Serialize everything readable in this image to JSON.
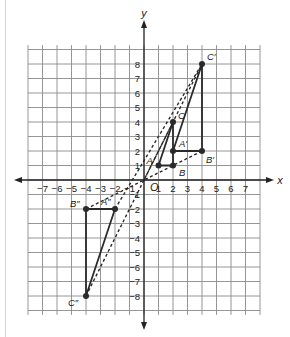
{
  "diagram": {
    "type": "coordinate-plane-dilation",
    "axes": {
      "x_label": "x",
      "y_label": "y",
      "origin_label": "O",
      "x_ticks": [
        "−7",
        "−6",
        "−5",
        "−4",
        "−3",
        "−2",
        "−1",
        "1",
        "2",
        "3",
        "4",
        "5",
        "6",
        "7"
      ],
      "y_ticks": [
        "8",
        "7",
        "6",
        "5",
        "4",
        "3",
        "2",
        "1",
        "−1",
        "−2",
        "−3",
        "−4",
        "−5",
        "−6",
        "−7",
        "−8"
      ],
      "range": {
        "xmin": -8,
        "xmax": 8,
        "ymin": -9,
        "ymax": 9
      }
    },
    "triangles": [
      {
        "name": "ABC",
        "vertices": [
          {
            "label": "A",
            "x": 1,
            "y": 1
          },
          {
            "label": "B",
            "x": 2,
            "y": 1
          },
          {
            "label": "C",
            "x": 2,
            "y": 4
          }
        ]
      },
      {
        "name": "A'B'C'",
        "vertices": [
          {
            "label": "A′",
            "x": 2,
            "y": 2
          },
          {
            "label": "B′",
            "x": 4,
            "y": 2
          },
          {
            "label": "C′",
            "x": 4,
            "y": 8
          }
        ]
      },
      {
        "name": "A\"B\"C\"",
        "vertices": [
          {
            "label": "A″",
            "x": -2,
            "y": -2
          },
          {
            "label": "B″",
            "x": -4,
            "y": -2
          },
          {
            "label": "C″",
            "x": -4,
            "y": -8
          }
        ]
      }
    ],
    "dashed_rays": [
      {
        "from": "C″",
        "to": "C′"
      },
      {
        "from": "A″",
        "to": "C′"
      },
      {
        "from": "B″",
        "to": "B′"
      }
    ],
    "colors": {
      "grid": "#8a8a8a",
      "axis": "#222222",
      "shape": "#2a2a2a",
      "background": "#ffffff"
    }
  }
}
